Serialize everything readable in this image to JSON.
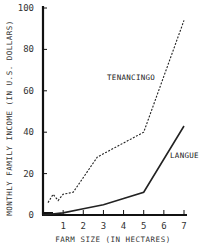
{
  "chart_data": {
    "type": "line",
    "title": "",
    "xlabel": "FARM SIZE (IN HECTARES)",
    "ylabel": "MONTHLY FAMILY INCOME (IN U.S. DOLLARS)",
    "xlim": [
      0,
      7
    ],
    "ylim": [
      0,
      100
    ],
    "x_ticks": [
      1,
      2,
      3,
      4,
      5,
      6,
      7
    ],
    "y_ticks": [
      0,
      20,
      40,
      60,
      80,
      100
    ],
    "grid": false,
    "legend": "inline labels",
    "series": [
      {
        "name": "TENANCINGO",
        "style": "dashed",
        "x": [
          0.25,
          0.5,
          0.75,
          1.0,
          1.5,
          2.7,
          5.0,
          7.0
        ],
        "y": [
          6,
          10,
          7,
          10,
          11,
          28,
          40,
          94
        ]
      },
      {
        "name": "LANGUE",
        "style": "solid",
        "x": [
          0,
          1,
          2,
          3,
          4,
          5,
          7
        ],
        "y": [
          0,
          1,
          3,
          5,
          8,
          11,
          43
        ]
      }
    ]
  },
  "labels": {
    "tenancingo": "TENANCINGO",
    "langue": "LANGUE",
    "xlabel": "FARM SIZE (IN HECTARES)",
    "ylabel": "MONTHLY FAMILY INCOME (IN U.S. DOLLARS)"
  }
}
